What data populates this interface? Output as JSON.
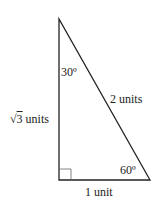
{
  "diagram": {
    "type": "right-triangle",
    "angles": {
      "top": "30º",
      "bottom_right": "60º",
      "bottom_left": "right-angle"
    },
    "sides": {
      "vertical": {
        "radical": "√",
        "value": "3",
        "unit": " units"
      },
      "hypotenuse": "2 units",
      "base": "1 unit"
    },
    "colors": {
      "stroke": "#222222",
      "background": "#ffffff"
    }
  }
}
